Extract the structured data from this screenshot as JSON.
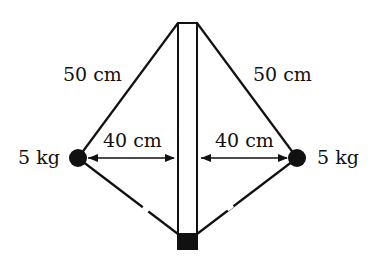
{
  "diagram": {
    "type": "physics-rotating-masses",
    "labels": {
      "upper_left_string": "50 cm",
      "upper_right_string": "50 cm",
      "left_mass": "5 kg",
      "right_mass": "5 kg",
      "left_distance": "40 cm",
      "right_distance": "40 cm"
    },
    "colors": {
      "ink": "#111111",
      "background": "#ffffff"
    }
  }
}
